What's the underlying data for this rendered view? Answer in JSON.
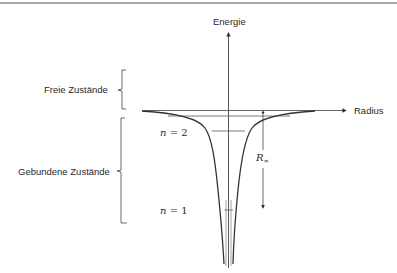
{
  "diagram": {
    "axes": {
      "y_label": "Energie",
      "x_label": "Radius"
    },
    "regions": {
      "free": "Freie Zustände",
      "bound": "Gebundene Zustände"
    },
    "levels": [
      {
        "n_symbol": "n",
        "eq": " = ",
        "value": "2"
      },
      {
        "n_symbol": "n",
        "eq": " = ",
        "value": "1"
      }
    ],
    "rydberg": {
      "symbol": "R",
      "subscript": "∞"
    },
    "colors": {
      "stroke": "#333333",
      "border": "#a8a8a8"
    }
  }
}
